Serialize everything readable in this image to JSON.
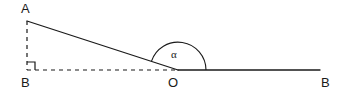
{
  "figure": {
    "kind": "geometry-diagram",
    "background_color": "#ffffff",
    "stroke_color": "#1a1a1a",
    "width": 351,
    "height": 99,
    "labels": {
      "apex": "A",
      "base_left": "B",
      "origin": "O",
      "ray_right": "B",
      "angle": "α"
    },
    "points": {
      "A": {
        "x": 27,
        "y": 21
      },
      "B_left": {
        "x": 27,
        "y": 70
      },
      "O": {
        "x": 178,
        "y": 70
      },
      "B_right": {
        "x": 320,
        "y": 70
      }
    },
    "segments": [
      {
        "name": "hypotenuse-AO",
        "from": "A",
        "to": "O",
        "style": "solid"
      },
      {
        "name": "vertical-leg-AB",
        "from": "A",
        "to": "B_left",
        "style": "dashed"
      },
      {
        "name": "horizontal-leg-BO",
        "from": "B_left",
        "to": "O",
        "style": "dashed"
      },
      {
        "name": "ray-OB",
        "from": "O",
        "to": "B_right",
        "style": "solid"
      }
    ],
    "markers": {
      "right_angle_at": "B_left",
      "right_angle_size": 8,
      "angle_arc_at": "O",
      "angle_arc_radius": 28
    }
  }
}
